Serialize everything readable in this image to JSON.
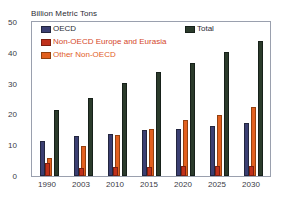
{
  "chart_data": {
    "type": "bar",
    "title": "Billion Metric Tons",
    "xlabel": "",
    "ylabel": "Billion Metric Tons",
    "ylim": [
      0,
      50
    ],
    "yticks": [
      0,
      10,
      20,
      30,
      40,
      50
    ],
    "ytick_labels": [
      "0",
      "10",
      "20",
      "30",
      "40",
      "50"
    ],
    "grid": false,
    "legend_position": "inside-top-left",
    "categories": [
      "1990",
      "2003",
      "2010",
      "2015",
      "2020",
      "2025",
      "2030"
    ],
    "series": [
      {
        "name": "OECD",
        "color": "#3b3f72",
        "values": [
          11.5,
          13.0,
          13.8,
          14.9,
          15.4,
          16.2,
          17.2
        ]
      },
      {
        "name": "Non-OECD Europe and Eurasia",
        "color": "#c0301a",
        "values": [
          4.1,
          2.6,
          2.8,
          2.9,
          3.1,
          3.2,
          3.4
        ]
      },
      {
        "name": "Other Non-OECD",
        "color": "#e2601f",
        "values": [
          5.9,
          9.6,
          13.2,
          15.3,
          18.3,
          19.8,
          22.3
        ]
      },
      {
        "name": "Total",
        "color": "#2b3b2b",
        "values": [
          21.5,
          25.3,
          30.3,
          33.8,
          36.8,
          40.3,
          43.8
        ]
      }
    ]
  },
  "chart": {
    "title": "Billion Metric Tons",
    "legend": [
      {
        "label": "OECD",
        "key": "oecd"
      },
      {
        "label": "Non-OECD Europe and Eurasia",
        "key": "noneur"
      },
      {
        "label": "Other Non-OECD",
        "key": "otheron"
      },
      {
        "label": "Total",
        "key": "total"
      }
    ]
  }
}
